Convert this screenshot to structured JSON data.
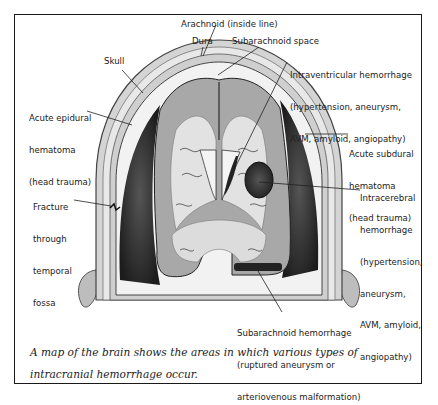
{
  "figure": {
    "labels": {
      "arachnoid": "Arachnoid (inside line)",
      "dura": "Dura",
      "subarachnoid_space": "Subarachnoid space",
      "skull": "Skull",
      "intraventricular": [
        "Intraventricular hemorrhage",
        "(hypertension, aneurysm,",
        "AVM, amyloid, angiopathy)"
      ],
      "epidural": [
        "Acute epidural",
        "hematoma",
        "(head trauma)"
      ],
      "subdural": [
        "Acute subdural",
        "hematoma",
        "(head trauma)"
      ],
      "fracture": [
        "Fracture",
        "through",
        "temporal",
        "fossa"
      ],
      "intracerebral": [
        "Intracerebral",
        "hemorrhage",
        "(hypertension,",
        "aneurysm,",
        "AVM, amyloid,",
        "angiopathy)"
      ],
      "subarachnoid_hemorrhage": [
        "Subarachnoid hemorrhage",
        "(ruptured aneurysm or",
        "arteriovenous malformation)"
      ]
    },
    "caption": "A map of the brain shows the areas in which various types of intracranial hemorrhage occur.",
    "colors": {
      "border": "#1a1a1a",
      "skull": "#c9c9c9",
      "brain_gray": "#a8a8a8",
      "brain_white": "#e2e2e2",
      "hematoma": "#2e2e2e",
      "text": "#222222"
    }
  }
}
